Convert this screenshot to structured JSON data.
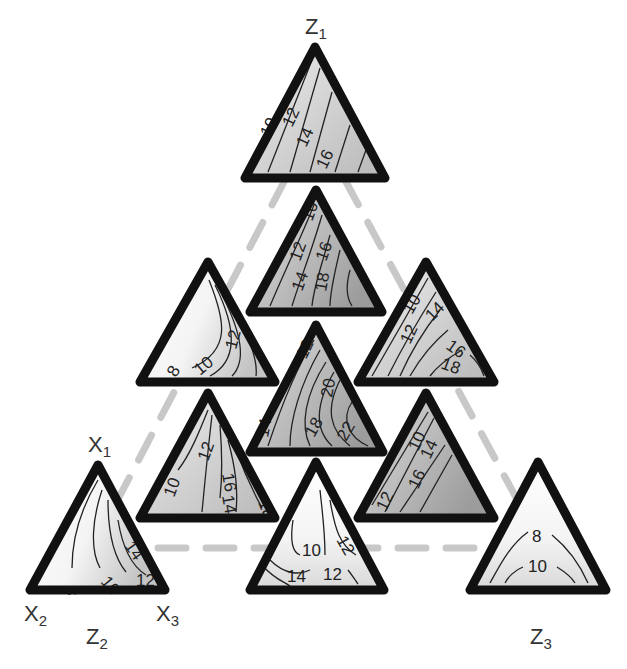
{
  "labels": {
    "z1": {
      "base": "Z",
      "sub": "1"
    },
    "z2": {
      "base": "Z",
      "sub": "2"
    },
    "z3": {
      "base": "Z",
      "sub": "3"
    },
    "x1": {
      "base": "X",
      "sub": "1"
    },
    "x2": {
      "base": "X",
      "sub": "2"
    },
    "x3": {
      "base": "X",
      "sub": "3"
    }
  },
  "colors": {
    "outline": "#111111",
    "contour": "#222222",
    "connector": "#c8c8c8",
    "fill_light": "#f2f2f2",
    "fill_mid": "#d4d4d4",
    "fill_dark": "#a8a8a8"
  },
  "triangles": [
    {
      "id": "t1",
      "name": "top-z1",
      "apex": [
        315,
        47
      ],
      "base_y": 178,
      "left_x": 245,
      "right_x": 385,
      "contour_labels": [
        "10",
        "12",
        "14",
        "16"
      ],
      "shade": "mid"
    },
    {
      "id": "t2",
      "name": "row2-center",
      "apex": [
        316,
        190
      ],
      "base_y": 312,
      "left_x": 250,
      "right_x": 382,
      "contour_labels": [
        "10",
        "12",
        "14",
        "16",
        "18"
      ],
      "shade": "dark"
    },
    {
      "id": "t3",
      "name": "row3-left",
      "apex": [
        208,
        262
      ],
      "base_y": 382,
      "left_x": 140,
      "right_x": 275,
      "contour_labels": [
        "8",
        "10",
        "12"
      ],
      "shade": "light"
    },
    {
      "id": "t4",
      "name": "row3-right",
      "apex": [
        426,
        262
      ],
      "base_y": 382,
      "left_x": 358,
      "right_x": 494,
      "contour_labels": [
        "10",
        "12",
        "14",
        "16",
        "18"
      ],
      "shade": "mid"
    },
    {
      "id": "t5",
      "name": "center",
      "apex": [
        316,
        325
      ],
      "base_y": 452,
      "left_x": 250,
      "right_x": 383,
      "contour_labels": [
        "12",
        "14",
        "18",
        "20",
        "22"
      ],
      "shade": "dark"
    },
    {
      "id": "t6",
      "name": "row4-left",
      "apex": [
        208,
        393
      ],
      "base_y": 518,
      "left_x": 140,
      "right_x": 275,
      "contour_labels": [
        "10",
        "12",
        "16",
        "14",
        "18"
      ],
      "shade": "mid"
    },
    {
      "id": "t7",
      "name": "row4-right",
      "apex": [
        426,
        393
      ],
      "base_y": 518,
      "left_x": 358,
      "right_x": 494,
      "contour_labels": [
        "12",
        "10",
        "14",
        "16"
      ],
      "shade": "dark"
    },
    {
      "id": "t8",
      "name": "bottom-left-z2",
      "apex": [
        98,
        465
      ],
      "base_y": 590,
      "left_x": 30,
      "right_x": 165,
      "contour_labels": [
        "8",
        "10",
        "12",
        "14"
      ],
      "shade": "light"
    },
    {
      "id": "t9",
      "name": "bottom-center",
      "apex": [
        316,
        462
      ],
      "base_y": 590,
      "left_x": 250,
      "right_x": 384,
      "contour_labels": [
        "10",
        "12",
        "14",
        "12"
      ],
      "shade": "light"
    },
    {
      "id": "t10",
      "name": "bottom-right-z3",
      "apex": [
        538,
        462
      ],
      "base_y": 590,
      "left_x": 470,
      "right_x": 606,
      "contour_labels": [
        "8",
        "10"
      ],
      "shade": "light"
    }
  ]
}
